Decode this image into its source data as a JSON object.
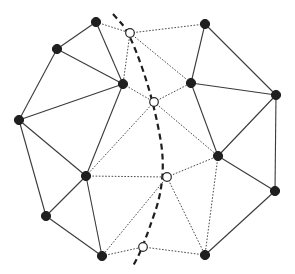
{
  "diagram": {
    "type": "graph-partition",
    "colors": {
      "filled_node": "#1f1f1f",
      "hollow_node_fill": "#ffffff",
      "solid_edge": "#3a3a3a",
      "dotted_edge": "#4a4a4a",
      "cut_path": "#1e1e1e"
    },
    "nodes_filled": [
      {
        "id": "A",
        "x": 96,
        "y": 22
      },
      {
        "id": "B",
        "x": 205,
        "y": 24
      },
      {
        "id": "C",
        "x": 57,
        "y": 49
      },
      {
        "id": "D",
        "x": 191,
        "y": 83
      },
      {
        "id": "E",
        "x": 123,
        "y": 84
      },
      {
        "id": "F",
        "x": 19,
        "y": 120
      },
      {
        "id": "G",
        "x": 276,
        "y": 95
      },
      {
        "id": "H",
        "x": 218,
        "y": 156
      },
      {
        "id": "I",
        "x": 86,
        "y": 176
      },
      {
        "id": "J",
        "x": 275,
        "y": 191
      },
      {
        "id": "K",
        "x": 46,
        "y": 216
      },
      {
        "id": "L",
        "x": 102,
        "y": 256
      },
      {
        "id": "M",
        "x": 205,
        "y": 255
      }
    ],
    "nodes_hollow": [
      {
        "id": "P1",
        "x": 130,
        "y": 33
      },
      {
        "id": "P2",
        "x": 154,
        "y": 102
      },
      {
        "id": "P3",
        "x": 167,
        "y": 177
      },
      {
        "id": "P4",
        "x": 143,
        "y": 247
      }
    ],
    "edges_solid": [
      [
        "A",
        "C"
      ],
      [
        "A",
        "E"
      ],
      [
        "C",
        "E"
      ],
      [
        "C",
        "F"
      ],
      [
        "E",
        "F"
      ],
      [
        "E",
        "I"
      ],
      [
        "F",
        "I"
      ],
      [
        "F",
        "K"
      ],
      [
        "I",
        "K"
      ],
      [
        "I",
        "L"
      ],
      [
        "K",
        "L"
      ],
      [
        "B",
        "D"
      ],
      [
        "B",
        "G"
      ],
      [
        "D",
        "G"
      ],
      [
        "D",
        "H"
      ],
      [
        "G",
        "H"
      ],
      [
        "G",
        "J"
      ],
      [
        "H",
        "J"
      ],
      [
        "J",
        "M"
      ]
    ],
    "edges_dotted": [
      [
        "A",
        "P1"
      ],
      [
        "P1",
        "B"
      ],
      [
        "P1",
        "E"
      ],
      [
        "P1",
        "D"
      ],
      [
        "E",
        "P2"
      ],
      [
        "P2",
        "D"
      ],
      [
        "P2",
        "I"
      ],
      [
        "P2",
        "H"
      ],
      [
        "I",
        "P3"
      ],
      [
        "P3",
        "H"
      ],
      [
        "P3",
        "L"
      ],
      [
        "P3",
        "M"
      ],
      [
        "H",
        "M"
      ],
      [
        "L",
        "P4"
      ],
      [
        "P4",
        "M"
      ]
    ],
    "cut_path_points": [
      [
        113,
        14
      ],
      [
        130,
        33
      ],
      [
        154,
        102
      ],
      [
        167,
        177
      ],
      [
        143,
        247
      ],
      [
        133,
        266
      ]
    ]
  }
}
